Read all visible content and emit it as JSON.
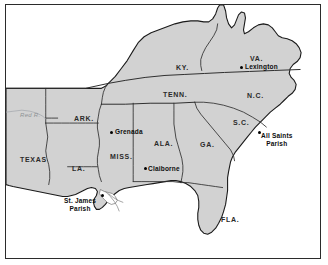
{
  "figure": {
    "kind": "reference-map",
    "region": "Southeastern United States",
    "frame_color": "#2b2b2b",
    "land_fill": "#d2d2d2",
    "water_fill": "#ffffff",
    "border_line_color": "#1a1a1a",
    "state_line_color": "#3a3a3a"
  },
  "state_labels": [
    {
      "text": "KY.",
      "x": 170,
      "y": 59
    },
    {
      "text": "VA.",
      "x": 244,
      "y": 50
    },
    {
      "text": "TENN.",
      "x": 157,
      "y": 86
    },
    {
      "text": "N.C.",
      "x": 241,
      "y": 87
    },
    {
      "text": "ARK.",
      "x": 68,
      "y": 110
    },
    {
      "text": "S.C.",
      "x": 227,
      "y": 114
    },
    {
      "text": "MISS.",
      "x": 104,
      "y": 148
    },
    {
      "text": "ALA.",
      "x": 148,
      "y": 135
    },
    {
      "text": "GA.",
      "x": 194,
      "y": 136
    },
    {
      "text": "TEXAS",
      "x": 14,
      "y": 151
    },
    {
      "text": "LA.",
      "x": 66,
      "y": 160
    },
    {
      "text": "FLA.",
      "x": 215,
      "y": 211
    }
  ],
  "river_labels": [
    {
      "text": "Red R.",
      "x": 14,
      "y": 107
    }
  ],
  "places": [
    {
      "name": "Lexington",
      "lines": [
        "Lexington"
      ],
      "dot": {
        "x": 234,
        "y": 61
      },
      "label": {
        "x": 239,
        "y": 58
      },
      "align": "left"
    },
    {
      "name": "All Saints Parish",
      "lines": [
        "All Saints",
        "Parish"
      ],
      "dot": {
        "x": 252,
        "y": 126
      },
      "label": {
        "x": 255,
        "y": 127
      },
      "align": "left"
    },
    {
      "name": "Grenada",
      "lines": [
        "Grenada"
      ],
      "dot": {
        "x": 104,
        "y": 126
      },
      "label": {
        "x": 109,
        "y": 123
      },
      "align": "left"
    },
    {
      "name": "Claiborne",
      "lines": [
        "Claiborne"
      ],
      "dot": {
        "x": 138,
        "y": 162
      },
      "label": {
        "x": 142,
        "y": 160
      },
      "align": "left"
    },
    {
      "name": "St. James Parish",
      "lines": [
        "St. James",
        "Parish"
      ],
      "dot": {
        "x": 95,
        "y": 189
      },
      "label": {
        "x": 58,
        "y": 192
      },
      "align": "left"
    }
  ]
}
